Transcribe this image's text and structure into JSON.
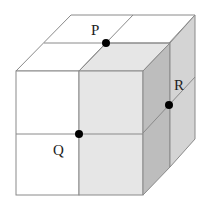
{
  "diagram": {
    "type": "2x2x2 cube",
    "colors": {
      "white": "#ffffff",
      "front_shaded": "#e6e6e6",
      "side_dark": "#bdbdbd",
      "side_light": "#d4d4d4",
      "edge": "#8a8a8a",
      "point": "#000000"
    },
    "points": [
      {
        "label": "P",
        "x": 106,
        "y": 43,
        "lx": 91,
        "ly": 35
      },
      {
        "label": "Q",
        "x": 79,
        "y": 134,
        "lx": 53,
        "ly": 155
      },
      {
        "label": "R",
        "x": 169,
        "y": 105,
        "lx": 173,
        "ly": 88
      }
    ]
  }
}
